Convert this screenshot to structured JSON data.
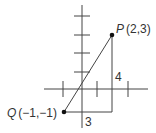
{
  "diagram": {
    "type": "coordinate-plane-right-triangle",
    "points": {
      "P": {
        "label": "P",
        "coords": "(2,3)"
      },
      "Q": {
        "label": "Q",
        "coords": "(−1,−1)"
      }
    },
    "legs": {
      "horizontal": "3",
      "vertical": "4"
    },
    "colors": {
      "line": "#333333",
      "point": "#111111",
      "background": "#ffffff"
    }
  }
}
